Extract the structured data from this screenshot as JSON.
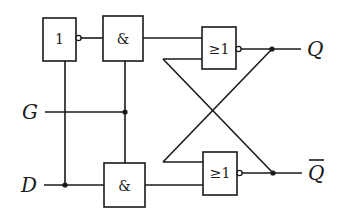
{
  "diagram": {
    "gates": {
      "not_gate": {
        "symbol": "1",
        "type": "NOT"
      },
      "and_top": {
        "symbol": "&",
        "type": "AND"
      },
      "and_bottom": {
        "symbol": "&",
        "type": "AND"
      },
      "nor_top": {
        "symbol": "≥1",
        "type": "NOR"
      },
      "nor_bottom": {
        "symbol": "≥1",
        "type": "NOR"
      }
    },
    "inputs": {
      "gate": "G",
      "data": "D"
    },
    "outputs": {
      "q": "Q",
      "q_bar": "Q"
    },
    "colors": {
      "line": "#1a1a1a",
      "background": "#ffffff"
    }
  }
}
